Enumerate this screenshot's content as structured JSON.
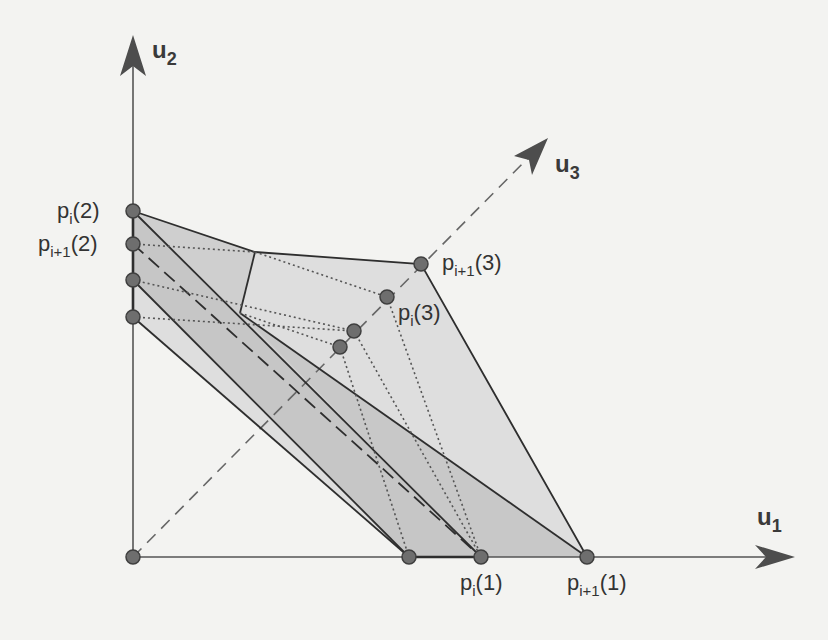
{
  "figure": {
    "type": "geometric-diagram",
    "background": "#f3f3f1",
    "colors": {
      "axis": "#555555",
      "arrowhead": "#4d4d4d",
      "point_fill": "#6e6e6e",
      "point_stroke": "#3f3f3f",
      "edge": "#2e2e2e",
      "fill_light": "#dcdcdc",
      "fill_mid": "#c9c9c9",
      "fill_dark": "#bdbdbd"
    },
    "axes": {
      "u1": {
        "label": "u",
        "subscript": "1"
      },
      "u2": {
        "label": "u",
        "subscript": "2"
      },
      "u3": {
        "label": "u",
        "subscript": "3"
      }
    },
    "point_labels": {
      "pi2": {
        "base": "p",
        "sub": "i",
        "arg": "(2)"
      },
      "pi1_2": {
        "base": "p",
        "sub": "i+1",
        "arg": "(2)"
      },
      "pi1_3": {
        "base": "p",
        "sub": "i+1",
        "arg": "(3)"
      },
      "pi3": {
        "base": "p",
        "sub": "i",
        "arg": "(3)"
      },
      "pi1": {
        "base": "p",
        "sub": "i",
        "arg": "(1)"
      },
      "pi1_1": {
        "base": "p",
        "sub": "i+1",
        "arg": "(1)"
      }
    },
    "points": [
      {
        "id": "origin",
        "x": 133,
        "y": 557
      },
      {
        "id": "p_i(2)",
        "x": 133,
        "y": 211
      },
      {
        "id": "p_i+1(2)",
        "x": 133,
        "y": 244
      },
      {
        "id": "u2-a",
        "x": 133,
        "y": 280
      },
      {
        "id": "u2-b",
        "x": 133,
        "y": 317
      },
      {
        "id": "u1-a",
        "x": 409,
        "y": 557
      },
      {
        "id": "p_i(1)",
        "x": 481,
        "y": 557
      },
      {
        "id": "p_i+1(1)",
        "x": 587,
        "y": 557
      },
      {
        "id": "p_i+1(3)",
        "x": 421,
        "y": 264
      },
      {
        "id": "p_i(3)",
        "x": 387,
        "y": 297
      },
      {
        "id": "u3-a",
        "x": 354,
        "y": 331
      },
      {
        "id": "u3-b",
        "x": 340,
        "y": 347
      }
    ]
  }
}
